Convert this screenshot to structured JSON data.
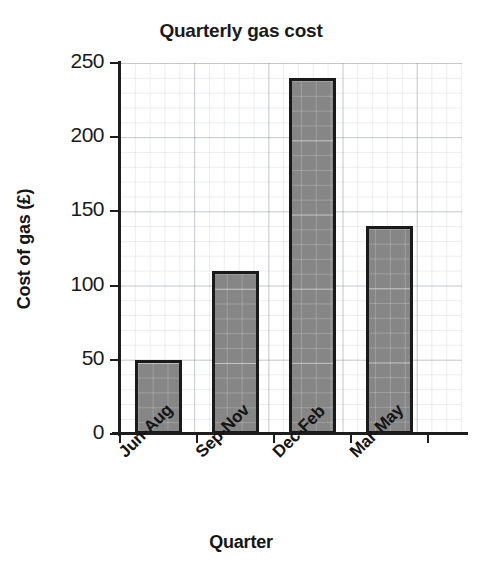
{
  "chart_data": {
    "type": "bar",
    "title": "Quarterly gas cost",
    "xlabel": "Quarter",
    "ylabel": "Cost of gas (£)",
    "categories": [
      "Jun-Aug",
      "Sep-Nov",
      "Dec-Feb",
      "Mar-May"
    ],
    "values": [
      50,
      110,
      240,
      140
    ],
    "ylim": [
      0,
      250
    ],
    "ytick_labels": [
      "0",
      "50",
      "100",
      "150",
      "200",
      "250"
    ],
    "ytick_values": [
      0,
      50,
      100,
      150,
      200,
      250
    ],
    "grid": true,
    "grid_minor": true,
    "legend": "none",
    "bar_color": "#868686",
    "bar_edge_color": "#1a1a1a",
    "axis_color": "#1d1d1d",
    "background_color": "#ffffff",
    "series": [
      {
        "name": "Cost of gas (£)",
        "values": [
          50,
          110,
          240,
          140
        ]
      }
    ]
  }
}
